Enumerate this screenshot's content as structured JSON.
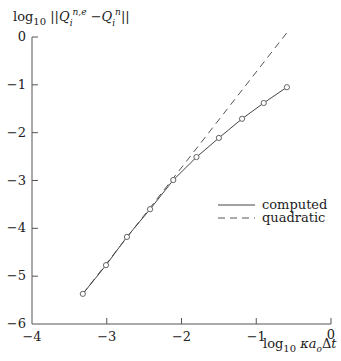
{
  "chart_data": {
    "type": "line",
    "title": "",
    "ylabel": "log10 ||Q_i^{n,e} − Q_i^n||",
    "xlabel": "log10 κ a_o Δt",
    "xlim": [
      -4,
      0
    ],
    "ylim": [
      -6,
      0
    ],
    "xticks": [
      -4,
      -3,
      -2,
      -1,
      0
    ],
    "yticks": [
      0,
      -1,
      -2,
      -3,
      -4,
      -5,
      -6
    ],
    "xtick_labels": [
      "−4",
      "−3",
      "−2",
      "−1",
      "0"
    ],
    "ytick_labels": [
      "0",
      "−1",
      "−2",
      "−3",
      "−4",
      "−5",
      "−6"
    ],
    "grid": false,
    "legend_position": "center-right",
    "series": [
      {
        "name": "computed",
        "style": "solid",
        "markers": "circle",
        "x": [
          -3.32,
          -3.01,
          -2.73,
          -2.42,
          -2.11,
          -1.8,
          -1.5,
          -1.19,
          -0.9,
          -0.59
        ],
        "y": [
          -5.37,
          -4.77,
          -4.18,
          -3.6,
          -2.99,
          -2.51,
          -2.11,
          -1.71,
          -1.38,
          -1.05
        ]
      },
      {
        "name": "quadratic",
        "style": "dashed",
        "markers": "none",
        "x": [
          -3.32,
          -0.59
        ],
        "y": [
          -5.37,
          0.09
        ]
      }
    ]
  },
  "labels": {
    "ylabel_prefix": "log",
    "ylabel_sub": "10",
    "ylabel_body": "||Q",
    "xlabel_prefix": "log",
    "xlabel_sub": "10",
    "xlabel_body": "κa",
    "xlabel_sub2": "o",
    "xlabel_tail": "Δt"
  },
  "legend": {
    "items": [
      {
        "label": "computed",
        "style": "solid"
      },
      {
        "label": "quadratic",
        "style": "dashed"
      }
    ]
  }
}
